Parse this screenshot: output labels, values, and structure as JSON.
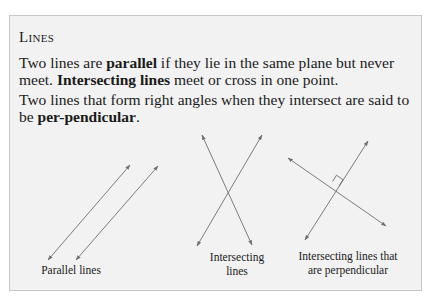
{
  "box": {
    "title": "Lines",
    "paragraph1": {
      "t1": "Two lines are ",
      "b1": "parallel",
      "t2": " if they lie in the same plane but never meet. ",
      "b2": "Intersecting lines",
      "t3": " meet or cross in one point."
    },
    "paragraph2": {
      "t1": "Two lines that form right angles when they intersect are said to be ",
      "b1": "per-pendicular",
      "t2": "."
    },
    "figures": [
      {
        "caption_line1": "Parallel lines",
        "caption_line2": ""
      },
      {
        "caption_line1": "Intersecting",
        "caption_line2": "lines"
      },
      {
        "caption_line1": "Intersecting lines that",
        "caption_line2": "are perpendicular"
      }
    ]
  },
  "colors": {
    "box_background": "#f2f2f2",
    "box_border": "#c6c6c6",
    "line": "#6e6e6e"
  }
}
